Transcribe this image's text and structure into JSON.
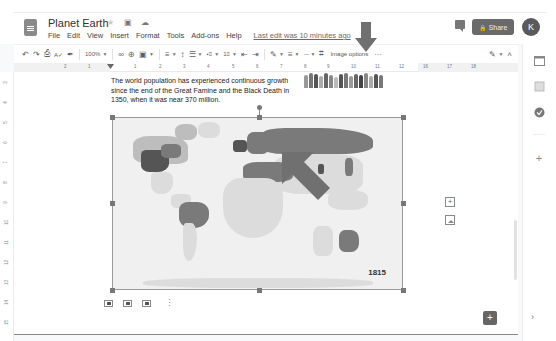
{
  "header": {
    "doc_title": "Planet Earth",
    "icons": [
      "star-icon",
      "move-to-folder-icon",
      "cloud-saved-icon"
    ],
    "menu": [
      "File",
      "Edit",
      "View",
      "Insert",
      "Format",
      "Tools",
      "Add-ons",
      "Help"
    ],
    "last_edit": "Last edit was 10 minutes ago",
    "share_label": "Share",
    "avatar_initial": "K"
  },
  "toolbar": {
    "zoom": "100%",
    "image_options": "Image options",
    "more": "···",
    "undo": "↶",
    "redo": "↷",
    "print": "⎙",
    "spellcheck": "A✓",
    "paint_format": "✒",
    "link": "∞",
    "comment": "⊕",
    "image": "▣",
    "align": "≡",
    "line_spacing": "↕",
    "checklist": "☰",
    "bullets": "•≡",
    "numbered": "1≡",
    "indent_dec": "⇤",
    "indent_inc": "⇥",
    "border_color": "✎",
    "border_weight": "≡",
    "border_dash": "┄",
    "crop": "⌗",
    "editing_mode": "✎",
    "collapse": "˄"
  },
  "ruler": {
    "horizontal_ticks": [
      "2",
      "1",
      "1",
      "2",
      "3",
      "4",
      "5",
      "6",
      "7",
      "8",
      "9",
      "10",
      "11",
      "12",
      "13",
      "14",
      "15",
      "16",
      "17",
      "18"
    ],
    "vertical_ticks": [
      "3",
      "4",
      "5",
      "6",
      "7",
      "8",
      "9",
      "10",
      "11",
      "12",
      "13",
      "14",
      "15",
      "16"
    ]
  },
  "document": {
    "paragraph": "The world population has experienced continuous growth since the end of the Great Famine and the Black Death in 1350, when it was near 370 million.",
    "map_year": "1815"
  },
  "floating": {
    "add_comment": "+",
    "explore": "+"
  },
  "side_panel": {
    "icons": [
      "calendar-icon",
      "keep-icon",
      "tasks-icon",
      "add-ons-plus-icon"
    ],
    "expand": "›"
  }
}
